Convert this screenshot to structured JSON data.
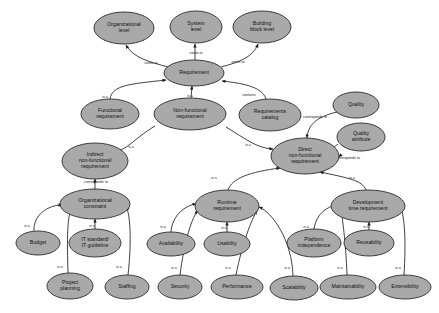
{
  "diagram": {
    "type": "node-link-graph",
    "background_color": "#ffffff",
    "node_fill_color": "#a9a9a9",
    "node_stroke_color": "#2b2b2b",
    "edge_color": "#1f1f1f",
    "nodes": [
      {
        "id": "org_level",
        "label": "Organizational\nlevel",
        "cx": 124,
        "cy": 28,
        "rx": 30,
        "ry": 16
      },
      {
        "id": "system_level",
        "label": "System\nlevel",
        "cx": 196,
        "cy": 27,
        "rx": 26,
        "ry": 16
      },
      {
        "id": "building_block",
        "label": "Building\nblock level",
        "cx": 262,
        "cy": 27,
        "rx": 29,
        "ry": 16
      },
      {
        "id": "requirement",
        "label": "Requirement",
        "cx": 194,
        "cy": 73,
        "rx": 30,
        "ry": 13
      },
      {
        "id": "functional_req",
        "label": "Functional\nrequirement",
        "cx": 110,
        "cy": 114,
        "rx": 29,
        "ry": 15
      },
      {
        "id": "nonfunctional_req",
        "label": "Non-functional\nrequirement",
        "cx": 190,
        "cy": 114,
        "rx": 36,
        "ry": 16
      },
      {
        "id": "req_catalog",
        "label": "Requirements\ncatalog",
        "cx": 270,
        "cy": 115,
        "rx": 31,
        "ry": 16
      },
      {
        "id": "quality",
        "label": "Quality",
        "cx": 356,
        "cy": 105,
        "rx": 23,
        "ry": 13
      },
      {
        "id": "quality_attr",
        "label": "Quality\nattribute",
        "cx": 361,
        "cy": 137,
        "rx": 24,
        "ry": 14
      },
      {
        "id": "indirect_nfr",
        "label": "Indirect\nnon-functional\nrequirement",
        "cx": 95,
        "cy": 161,
        "rx": 33,
        "ry": 18
      },
      {
        "id": "direct_nfr",
        "label": "Direct\nnon-functional\nrequirement",
        "cx": 305,
        "cy": 156,
        "rx": 34,
        "ry": 18
      },
      {
        "id": "org_constraint",
        "label": "Organizational\nconstraint",
        "cx": 95,
        "cy": 204,
        "rx": 35,
        "ry": 15
      },
      {
        "id": "runtime_req",
        "label": "Runtime\nrequirement",
        "cx": 227,
        "cy": 206,
        "rx": 32,
        "ry": 16
      },
      {
        "id": "dev_time_req",
        "label": "Development\ntime requirement",
        "cx": 368,
        "cy": 206,
        "rx": 37,
        "ry": 16
      },
      {
        "id": "budget",
        "label": "Budget",
        "cx": 38,
        "cy": 243,
        "rx": 22,
        "ry": 12
      },
      {
        "id": "it_standard",
        "label": "IT standard/\nIT guideline",
        "cx": 95,
        "cy": 243,
        "rx": 26,
        "ry": 14
      },
      {
        "id": "availability",
        "label": "Availability",
        "cx": 171,
        "cy": 244,
        "rx": 24,
        "ry": 12
      },
      {
        "id": "usability",
        "label": "Usability",
        "cx": 227,
        "cy": 244,
        "rx": 23,
        "ry": 12
      },
      {
        "id": "platform_indep",
        "label": "Platform\nindependence",
        "cx": 314,
        "cy": 243,
        "rx": 27,
        "ry": 14
      },
      {
        "id": "reusability",
        "label": "Reusability",
        "cx": 369,
        "cy": 243,
        "rx": 25,
        "ry": 13
      },
      {
        "id": "project_planning",
        "label": "Project\nplanning",
        "cx": 70,
        "cy": 286,
        "rx": 23,
        "ry": 13
      },
      {
        "id": "staffing",
        "label": "Staffing",
        "cx": 127,
        "cy": 287,
        "rx": 22,
        "ry": 12
      },
      {
        "id": "security",
        "label": "Security",
        "cx": 180,
        "cy": 287,
        "rx": 22,
        "ry": 12
      },
      {
        "id": "performance",
        "label": "Performance",
        "cx": 237,
        "cy": 287,
        "rx": 26,
        "ry": 12
      },
      {
        "id": "scalability",
        "label": "Scalability",
        "cx": 294,
        "cy": 288,
        "rx": 24,
        "ry": 12
      },
      {
        "id": "maintainability",
        "label": "Maintainability",
        "cx": 348,
        "cy": 287,
        "rx": 28,
        "ry": 12
      },
      {
        "id": "extensibility",
        "label": "Extensibility",
        "cx": 405,
        "cy": 287,
        "rx": 26,
        "ry": 12
      }
    ],
    "edges": [
      {
        "from": "requirement",
        "to": "org_level",
        "label": "exists at",
        "label_x": 151,
        "label_y": 63,
        "path": "M 168 67 C 150 62 133 58 126 45"
      },
      {
        "from": "requirement",
        "to": "system_level",
        "label": "exists at",
        "label_x": 196,
        "label_y": 53,
        "path": "M 195 60 L 195 44"
      },
      {
        "from": "requirement",
        "to": "building_block",
        "label": "exists at",
        "label_x": 238,
        "label_y": 62,
        "path": "M 221 67 C 240 62 253 57 258 44"
      },
      {
        "from": "requirement",
        "to": "functional_req",
        "label": "is a",
        "label_x": 105,
        "label_y": 97,
        "path": "M 166 80 C 130 84 112 85 110 99",
        "reverse": true
      },
      {
        "from": "requirement",
        "to": "nonfunctional_req",
        "label": "is a",
        "label_x": 190,
        "label_y": 96,
        "path": "M 192 86 L 191 98",
        "reverse": true
      },
      {
        "from": "req_catalog",
        "to": "requirement",
        "label": "contains",
        "label_x": 249,
        "label_y": 95,
        "path": "M 266 99 C 262 86 240 83 222 81"
      },
      {
        "from": "nonfunctional_req",
        "to": "indirect_nfr",
        "label": "is a",
        "label_x": 131,
        "label_y": 147,
        "path": "M 113 152 C 128 150 132 140 155 126",
        "reverse": true
      },
      {
        "from": "nonfunctional_req",
        "to": "direct_nfr",
        "label": "is a",
        "label_x": 248,
        "label_y": 145,
        "path": "M 273 149 C 256 148 246 139 226 127",
        "reverse": true
      },
      {
        "from": "quality",
        "to": "direct_nfr",
        "label": "corresponds to",
        "label_x": 315,
        "label_y": 117,
        "path": "M 337 112 C 316 117 308 125 307 138"
      },
      {
        "from": "quality_attr",
        "to": "direct_nfr",
        "label": "corresponds to",
        "label_x": 348,
        "label_y": 158,
        "path": "M 338 144 C 330 150 326 155 340 156 L 339 157"
      },
      {
        "from": "indirect_nfr",
        "to": "org_constraint",
        "label": "corresponds to",
        "label_x": 96,
        "label_y": 182,
        "path": "M 95 179 L 95 189",
        "reverse": true
      },
      {
        "from": "direct_nfr",
        "to": "runtime_req",
        "label": "is a",
        "label_x": 214,
        "label_y": 178,
        "path": "M 280 168 C 250 172 232 178 228 190",
        "reverse": true
      },
      {
        "from": "direct_nfr",
        "to": "dev_time_req",
        "label": "is a",
        "label_x": 352,
        "label_y": 178,
        "path": "M 320 172 C 348 178 362 180 366 190",
        "reverse": true
      },
      {
        "from": "budget",
        "to": "org_constraint",
        "label": "is a",
        "label_x": 27,
        "label_y": 226,
        "path": "M 34 231 C 33 215 48 205 62 205"
      },
      {
        "from": "it_standard",
        "to": "org_constraint",
        "label": "is a",
        "label_x": 92,
        "label_y": 226,
        "path": "M 95 229 L 95 219"
      },
      {
        "from": "project_planning",
        "to": "org_constraint",
        "label": "is a",
        "label_x": 60,
        "label_y": 267,
        "path": "M 68 273 C 67 240 67 215 72 208"
      },
      {
        "from": "staffing",
        "to": "org_constraint",
        "label": "is a",
        "label_x": 119,
        "label_y": 267,
        "path": "M 128 275 C 132 240 130 212 126 207"
      },
      {
        "from": "availability",
        "to": "runtime_req",
        "label": "is a",
        "label_x": 163,
        "label_y": 227,
        "path": "M 171 232 C 172 215 186 205 196 204"
      },
      {
        "from": "usability",
        "to": "runtime_req",
        "label": "is a",
        "label_x": 224,
        "label_y": 228,
        "path": "M 227 232 L 227 222"
      },
      {
        "from": "security",
        "to": "runtime_req",
        "label": "is a",
        "label_x": 174,
        "label_y": 268,
        "path": "M 180 275 C 184 243 192 216 198 211"
      },
      {
        "from": "performance",
        "to": "runtime_req",
        "label": "is a",
        "label_x": 228,
        "label_y": 268,
        "path": "M 236 275 C 242 244 252 218 257 211"
      },
      {
        "from": "scalability",
        "to": "runtime_req",
        "label": "is a",
        "label_x": 287,
        "label_y": 268,
        "path": "M 293 276 C 292 240 272 212 259 207"
      },
      {
        "from": "platform_indep",
        "to": "dev_time_req",
        "label": "is a",
        "label_x": 306,
        "label_y": 227,
        "path": "M 314 229 C 316 214 327 206 338 205"
      },
      {
        "from": "reusability",
        "to": "dev_time_req",
        "label": "is a",
        "label_x": 366,
        "label_y": 227,
        "path": "M 369 230 L 369 222"
      },
      {
        "from": "maintainability",
        "to": "dev_time_req",
        "label": "is a",
        "label_x": 340,
        "label_y": 268,
        "path": "M 347 275 C 346 244 342 215 341 209"
      },
      {
        "from": "extensibility",
        "to": "dev_time_req",
        "label": "is a",
        "label_x": 398,
        "label_y": 268,
        "path": "M 404 275 C 406 244 405 214 400 207"
      }
    ]
  }
}
